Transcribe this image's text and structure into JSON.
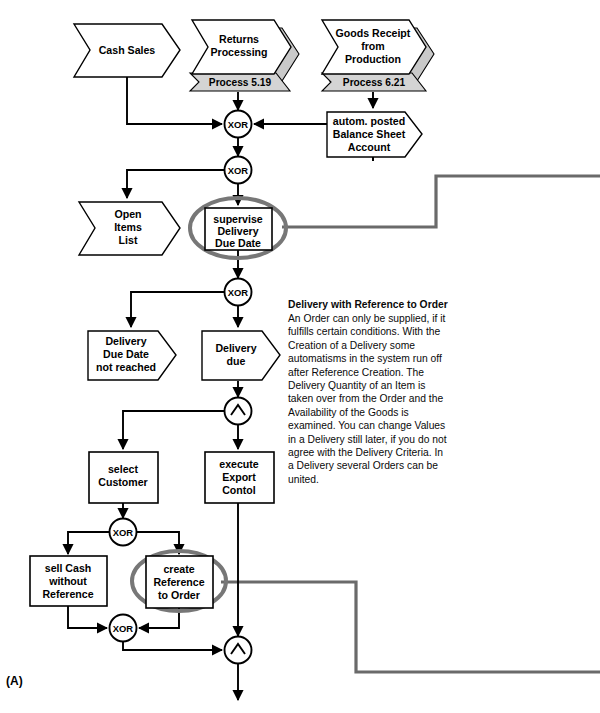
{
  "diagram": {
    "figure_label": "(A)",
    "type": "event-driven process chain (EPC) flowchart",
    "colors": {
      "stroke": "#000000",
      "highlight_ellipse": "#777777",
      "connector_line_gray": "#6a6a6a",
      "process_band_fill": "#d4d4d4",
      "shadow_fill": "#c9c9c9"
    },
    "events": [
      {
        "id": "cash-sales",
        "label": "Cash Sales",
        "shape": "event-chevron"
      },
      {
        "id": "returns-processing",
        "label": "Returns\nProcessing",
        "shape": "event-chevron",
        "process_ref": "Process 5.19"
      },
      {
        "id": "goods-receipt",
        "label": "Goods Receipt\nfrom\nProduction",
        "shape": "event-chevron",
        "process_ref": "Process 6.21"
      },
      {
        "id": "balance-sheet",
        "label": "autom. posted\nBalance Sheet\nAccount",
        "shape": "event-flat"
      },
      {
        "id": "open-items-list",
        "label": "Open\nItems\nList",
        "shape": "event-chevron"
      },
      {
        "id": "due-not-reached",
        "label": "Delivery\nDue Date\nnot reached",
        "shape": "event-flat"
      },
      {
        "id": "delivery-due",
        "label": "Delivery\ndue",
        "shape": "event-flat"
      }
    ],
    "functions": [
      {
        "id": "supervise",
        "label": "supervise\nDelivery\nDue Date",
        "highlighted": true
      },
      {
        "id": "select-customer",
        "label": "select\nCustomer",
        "highlighted": false
      },
      {
        "id": "export-control",
        "label": "execute\nExport\nContol",
        "highlighted": false
      },
      {
        "id": "sell-cash",
        "label": "sell Cash\nwithout\nReference",
        "highlighted": false
      },
      {
        "id": "create-reference",
        "label": "create\nReference\nto Order",
        "highlighted": true
      }
    ],
    "connectors": [
      {
        "id": "xor-1",
        "label": "XOR",
        "x": 238,
        "y": 124
      },
      {
        "id": "xor-2",
        "label": "XOR",
        "x": 238,
        "y": 170
      },
      {
        "id": "xor-3",
        "label": "XOR",
        "x": 238,
        "y": 292
      },
      {
        "id": "and-1",
        "label": "∧",
        "x": 238,
        "y": 411
      },
      {
        "id": "xor-4",
        "label": "XOR",
        "x": 123,
        "y": 532
      },
      {
        "id": "xor-5",
        "label": "XOR",
        "x": 123,
        "y": 628
      },
      {
        "id": "and-2",
        "label": "∧",
        "x": 238,
        "y": 650
      }
    ],
    "event_labels": {
      "cash_sales": "Cash Sales",
      "returns_processing_l1": "Returns",
      "returns_processing_l2": "Processing",
      "process_519": "Process 5.19",
      "goods_receipt_l1": "Goods Receipt",
      "goods_receipt_l2": "from",
      "goods_receipt_l3": "Production",
      "process_621": "Process 6.21",
      "balance_l1": "autom. posted",
      "balance_l2": "Balance Sheet",
      "balance_l3": "Account",
      "open_items_l1": "Open",
      "open_items_l2": "Items",
      "open_items_l3": "List",
      "not_reached_l1": "Delivery",
      "not_reached_l2": "Due Date",
      "not_reached_l3": "not reached",
      "delivery_due_l1": "Delivery",
      "delivery_due_l2": "due"
    },
    "function_labels": {
      "supervise_l1": "supervise",
      "supervise_l2": "Delivery",
      "supervise_l3": "Due Date",
      "select_customer_l1": "select",
      "select_customer_l2": "Customer",
      "export_control_l1": "execute",
      "export_control_l2": "Export",
      "export_control_l3": "Contol",
      "sell_cash_l1": "sell Cash",
      "sell_cash_l2": "without",
      "sell_cash_l3": "Reference",
      "create_reference_l1": "create",
      "create_reference_l2": "Reference",
      "create_reference_l3": "to Order"
    },
    "connector_labels": {
      "xor": "XOR",
      "and": "∧"
    },
    "note": {
      "title": "Delivery with Reference to Order",
      "body": "An Order can only be supplied, if it fulfills certain conditions. With the Creation of a Delivery some automatisms in the system run off after Reference Creation. The Delivery Quantity of an Item is taken over from the Order and the Availability of the Goods is examined. You can change Values in a Delivery still later, if you do not agree with the Delivery Criteria. In a Delivery several Orders can be united."
    }
  }
}
